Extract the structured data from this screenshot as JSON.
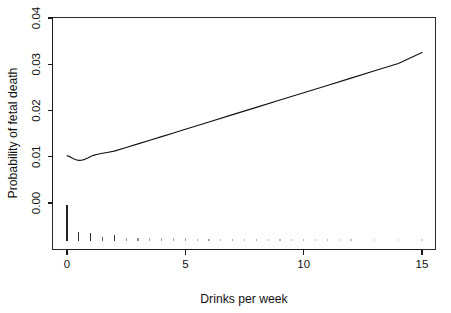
{
  "chart_data": {
    "type": "line",
    "title": "",
    "subtitle": "",
    "xlabel": "Drinks per week",
    "ylabel": "Probability of fetal death",
    "xlim": [
      -0.55,
      15.6
    ],
    "ylim": [
      -0.0085,
      0.0413
    ],
    "xticks": [
      0,
      5,
      10,
      15
    ],
    "xticklabels": [
      "0",
      "5",
      "10",
      "15"
    ],
    "yticks": [
      0.0,
      0.01,
      0.02,
      0.03,
      0.04
    ],
    "yticklabels": [
      "0.00",
      "0.01",
      "0.02",
      "0.03",
      "0.04"
    ],
    "grid": false,
    "legend": null,
    "series": [
      {
        "name": "Fitted probability of fetal death",
        "x": [
          0.0,
          0.12,
          0.25,
          0.38,
          0.5,
          0.62,
          0.75,
          0.88,
          1.0,
          1.12,
          1.25,
          1.5,
          1.75,
          2.0,
          2.5,
          3.0,
          3.5,
          4.0,
          4.5,
          5.0,
          6.0,
          7.0,
          8.0,
          9.0,
          10.0,
          11.0,
          12.0,
          13.0,
          14.0,
          15.0
        ],
        "y": [
          0.01022,
          0.01002,
          0.00964,
          0.00934,
          0.00921,
          0.00925,
          0.00944,
          0.00973,
          0.01005,
          0.01031,
          0.01048,
          0.01075,
          0.01098,
          0.01122,
          0.012,
          0.01278,
          0.01357,
          0.01436,
          0.01515,
          0.01594,
          0.01752,
          0.0191,
          0.02068,
          0.02226,
          0.02384,
          0.02542,
          0.027,
          0.02858,
          0.03016,
          0.03252
        ]
      }
    ],
    "rug": {
      "description": "rug plot of observed drinks-per-week values below the axis, bar height proportional to frequency",
      "x": [
        0.0,
        0.5,
        1.0,
        1.5,
        2.0,
        2.5,
        3.0,
        3.5,
        4.0,
        4.5,
        5.0,
        5.5,
        6.0,
        6.5,
        7.0,
        7.5,
        8.0,
        8.5,
        9.0,
        9.5,
        10.0,
        10.5,
        11.0,
        11.5,
        12.0,
        13.0,
        14.0,
        15.0
      ],
      "heights": [
        1.0,
        0.24,
        0.22,
        0.1,
        0.14,
        0.07,
        0.07,
        0.06,
        0.06,
        0.06,
        0.06,
        0.05,
        0.05,
        0.05,
        0.05,
        0.05,
        0.05,
        0.05,
        0.05,
        0.05,
        0.05,
        0.05,
        0.05,
        0.05,
        0.05,
        0.05,
        0.05,
        0.05
      ],
      "opacities": [
        1.0,
        0.95,
        0.95,
        0.7,
        0.9,
        0.45,
        0.5,
        0.4,
        0.4,
        0.38,
        0.4,
        0.35,
        0.38,
        0.34,
        0.36,
        0.32,
        0.34,
        0.3,
        0.33,
        0.3,
        0.32,
        0.28,
        0.3,
        0.26,
        0.28,
        0.22,
        0.2,
        0.2
      ]
    },
    "colors": {
      "line": "#111111",
      "axis": "#1a1a1a",
      "frame": "#2b2b2b",
      "background": "#ffffff",
      "rug": "#222222"
    }
  }
}
